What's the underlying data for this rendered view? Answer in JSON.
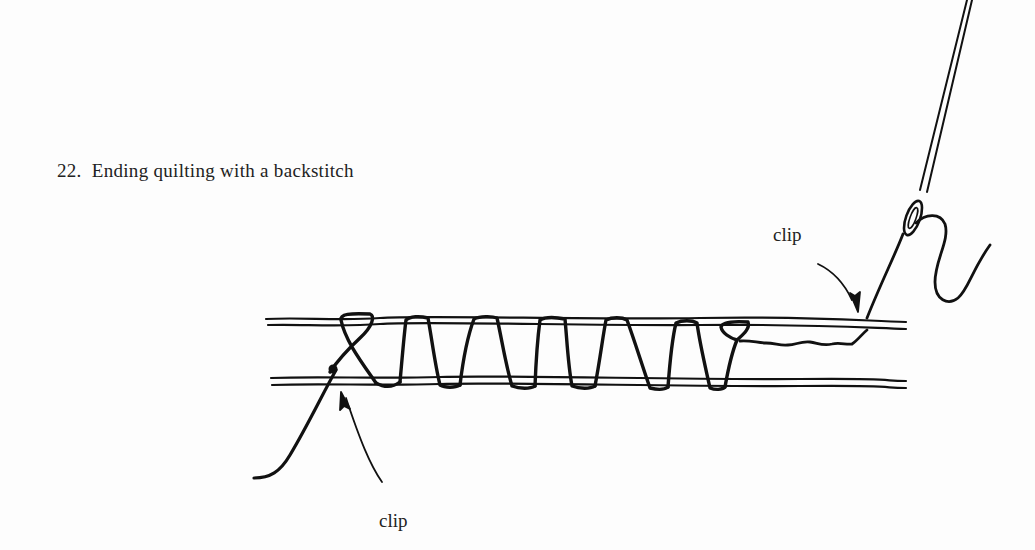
{
  "figure": {
    "number": "22.",
    "caption": "Ending quilting with a backstitch",
    "full_caption": "22.  Ending quilting with a backstitch"
  },
  "labels": {
    "clip_top": "clip",
    "clip_bottom": "clip"
  },
  "illustration": {
    "elements": [
      "fabric-layer-top",
      "fabric-layer-bottom",
      "quilting-stitches",
      "backstitch-knot",
      "thread-tail",
      "needle",
      "needle-eye",
      "thread-loop",
      "buried-thread",
      "arrow-clip-top",
      "arrow-clip-bottom"
    ],
    "stitch_count": 6,
    "ink_color": "#111111",
    "paper_color": "#fdfdfd"
  }
}
